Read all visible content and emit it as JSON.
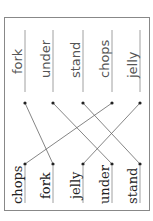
{
  "worksheet": {
    "title": "",
    "orientation": "rotated -90deg",
    "top_words": [
      "fork",
      "under",
      "stand",
      "chops",
      "jelly"
    ],
    "bottom_words": [
      "chops",
      "fork",
      "jelly",
      "under",
      "stand"
    ],
    "matches": [
      {
        "from": "fork",
        "to": "fork"
      },
      {
        "from": "under",
        "to": "under"
      },
      {
        "from": "stand",
        "to": "stand"
      },
      {
        "from": "chops",
        "to": "chops"
      },
      {
        "from": "jelly",
        "to": "jelly"
      }
    ]
  }
}
